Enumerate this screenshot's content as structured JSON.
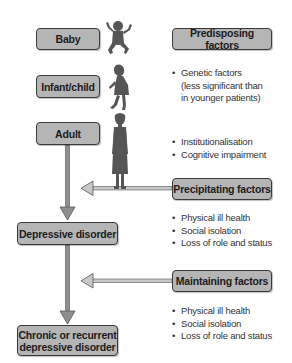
{
  "life_stages": [
    {
      "label": "Baby"
    },
    {
      "label": "Infant/child"
    },
    {
      "label": "Adult"
    }
  ],
  "outcomes": [
    {
      "label": "Depressive disorder"
    },
    {
      "label": "Chronic or recurrent\ndepressive disorder"
    }
  ],
  "factors": {
    "predisposing": {
      "label": "Predisposing factors",
      "items": [
        {
          "text": "Genetic factors",
          "cont": [
            "(less significant than",
            "in younger patients)"
          ]
        },
        {
          "text": "Institutionalisation"
        },
        {
          "text": "Cognitive impairment"
        }
      ]
    },
    "precipitating": {
      "label": "Precipitating factors",
      "items": [
        "Physical ill health",
        "Social isolation",
        "Loss of role and status"
      ]
    },
    "maintaining": {
      "label": "Maintaining factors",
      "items": [
        "Physical ill health",
        "Social isolation",
        "Loss of role and status"
      ]
    }
  },
  "icons": [
    "baby-silhouette-icon",
    "child-silhouette-icon",
    "adult-woman-silhouette-icon"
  ],
  "colors": {
    "box_fill": "#b5b5b5",
    "box_border": "#3a3a3a",
    "arrow": "#8a8a8a",
    "silhouette": "#555555"
  }
}
